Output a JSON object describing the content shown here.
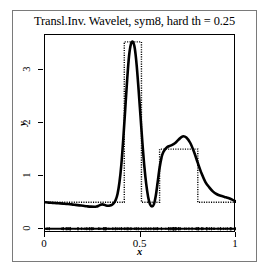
{
  "figure": {
    "title": "Transl.Inv. Wavelet, sym8, hard th = 0.25",
    "xlabel": "x",
    "ylabel": "y",
    "background_color": "#ffffff",
    "frame_color": "#7a7a7a",
    "axis_color": "#000000"
  },
  "axes": {
    "x_ticks": [
      {
        "value": 0,
        "label": "0"
      },
      {
        "value": 0.5,
        "label": "0.5"
      },
      {
        "value": 1,
        "label": "1"
      }
    ],
    "y_ticks": [
      {
        "value": 0,
        "label": "0"
      },
      {
        "value": 1,
        "label": "1"
      },
      {
        "value": 2,
        "label": "2"
      },
      {
        "value": 3,
        "label": "3"
      }
    ],
    "xlim": [
      0,
      1
    ],
    "ylim": [
      -0.08,
      3.65
    ],
    "grid": false
  },
  "chart_data": {
    "type": "line",
    "title": "Transl.Inv. Wavelet, sym8, hard th = 0.25",
    "xlabel": "x",
    "ylabel": "y",
    "xlim": [
      0,
      1
    ],
    "ylim": [
      -0.08,
      3.65
    ],
    "grid": false,
    "legend_position": "none",
    "series": [
      {
        "name": "Translation-invariant wavelet estimate",
        "style": "solid",
        "color": "#000000",
        "linewidth": 2.6,
        "x": [
          0.0,
          0.02,
          0.04,
          0.06,
          0.08,
          0.1,
          0.12,
          0.14,
          0.16,
          0.18,
          0.2,
          0.22,
          0.24,
          0.26,
          0.27,
          0.28,
          0.29,
          0.3,
          0.31,
          0.32,
          0.33,
          0.34,
          0.35,
          0.36,
          0.37,
          0.38,
          0.39,
          0.4,
          0.41,
          0.42,
          0.43,
          0.44,
          0.45,
          0.46,
          0.47,
          0.48,
          0.49,
          0.5,
          0.51,
          0.52,
          0.53,
          0.54,
          0.55,
          0.56,
          0.57,
          0.58,
          0.59,
          0.6,
          0.61,
          0.62,
          0.64,
          0.66,
          0.68,
          0.7,
          0.72,
          0.74,
          0.76,
          0.78,
          0.8,
          0.82,
          0.84,
          0.86,
          0.88,
          0.9,
          0.92,
          0.94,
          0.96,
          0.98,
          1.0
        ],
        "y": [
          0.5,
          0.492,
          0.487,
          0.482,
          0.478,
          0.472,
          0.466,
          0.459,
          0.45,
          0.441,
          0.432,
          0.423,
          0.416,
          0.414,
          0.418,
          0.432,
          0.45,
          0.46,
          0.452,
          0.438,
          0.432,
          0.436,
          0.45,
          0.48,
          0.54,
          0.66,
          0.88,
          1.22,
          1.7,
          2.25,
          2.8,
          3.25,
          3.48,
          3.52,
          3.4,
          3.08,
          2.62,
          2.12,
          1.62,
          1.18,
          0.84,
          0.6,
          0.46,
          0.42,
          0.46,
          0.62,
          0.88,
          1.15,
          1.34,
          1.45,
          1.54,
          1.57,
          1.61,
          1.68,
          1.74,
          1.72,
          1.62,
          1.45,
          1.24,
          1.04,
          0.88,
          0.78,
          0.7,
          0.65,
          0.62,
          0.6,
          0.58,
          0.55,
          0.51
        ]
      },
      {
        "name": "True piecewise-constant signal",
        "style": "dotted",
        "color": "#000000",
        "linewidth": 1.4,
        "x": [
          0.0,
          0.415,
          0.415,
          0.505,
          0.505,
          0.6,
          0.6,
          0.8,
          0.8,
          1.0
        ],
        "y": [
          0.5,
          0.5,
          3.52,
          3.52,
          0.5,
          0.5,
          1.5,
          1.5,
          0.5,
          0.5
        ]
      },
      {
        "name": "Residual rug at baseline",
        "style": "rug",
        "color": "#000000",
        "linewidth": 2.2,
        "x": [
          0.0,
          1.0
        ],
        "y": [
          0.0,
          0.0
        ]
      }
    ]
  }
}
